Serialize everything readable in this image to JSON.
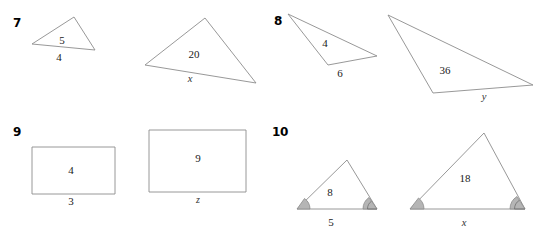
{
  "page": {
    "background_color": "#ffffff",
    "stroke_color": "#8c8c8c",
    "label_color": "#1a1a1a",
    "angle_fill_color": "#b3b3b3"
  },
  "problems": [
    {
      "number": "7",
      "type": "triangle-pair",
      "figures": [
        {
          "role": "small",
          "labels": {
            "interior": "5",
            "base": "4"
          }
        },
        {
          "role": "large",
          "labels": {
            "interior": "20",
            "base": "x"
          }
        }
      ]
    },
    {
      "number": "8",
      "type": "triangle-pair",
      "figures": [
        {
          "role": "small",
          "labels": {
            "interior": "4",
            "base": "6"
          }
        },
        {
          "role": "large",
          "labels": {
            "interior": "36",
            "base": "y"
          }
        }
      ]
    },
    {
      "number": "9",
      "type": "rectangle-pair",
      "figures": [
        {
          "role": "small",
          "labels": {
            "interior": "4",
            "base": "3"
          }
        },
        {
          "role": "large",
          "labels": {
            "interior": "9",
            "base": "z"
          }
        }
      ]
    },
    {
      "number": "10",
      "type": "triangle-pair-with-angles",
      "figures": [
        {
          "role": "small",
          "labels": {
            "interior": "8",
            "base": "5"
          },
          "angle_marks": [
            "left-single-arc",
            "right-double-arc"
          ]
        },
        {
          "role": "large",
          "labels": {
            "interior": "18",
            "base": "x"
          },
          "angle_marks": [
            "left-single-arc",
            "right-double-arc"
          ]
        }
      ]
    }
  ],
  "numbers": {
    "p7": "7",
    "p8": "8",
    "p9": "9",
    "p10": "10"
  },
  "labels": {
    "p7_small_interior": "5",
    "p7_small_base": "4",
    "p7_large_interior": "20",
    "p7_large_base": "x",
    "p8_small_interior": "4",
    "p8_small_base": "6",
    "p8_large_interior": "36",
    "p8_large_base": "y",
    "p9_small_interior": "4",
    "p9_small_base": "3",
    "p9_large_interior": "9",
    "p9_large_base": "z",
    "p10_small_interior": "8",
    "p10_small_base": "5",
    "p10_large_interior": "18",
    "p10_large_base": "x"
  }
}
